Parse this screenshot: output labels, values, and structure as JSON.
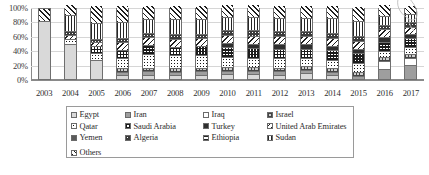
{
  "chart_data": {
    "type": "bar",
    "stacked": true,
    "normalized": "100%",
    "title": "",
    "xlabel": "",
    "ylabel": "",
    "ylim": [
      0,
      100
    ],
    "ytick_labels": [
      "100%",
      "80%",
      "60%",
      "40%",
      "20%",
      "0%"
    ],
    "ytick_values": [
      100,
      80,
      60,
      40,
      20,
      0
    ],
    "grid": true,
    "legend_position": "bottom",
    "categories": [
      "2003",
      "2004",
      "2005",
      "2006",
      "2007",
      "2008",
      "2009",
      "2010",
      "2011",
      "2012",
      "2013",
      "2014",
      "2015",
      "2016",
      "2017"
    ],
    "series": [
      {
        "name": "Egypt",
        "pattern": "p-lightgray",
        "values": [
          82,
          49,
          26,
          5,
          5,
          4,
          5,
          6,
          6,
          5,
          7,
          4,
          0,
          0,
          0
        ]
      },
      {
        "name": "Iran",
        "pattern": "p-midgray",
        "values": [
          0,
          0,
          0,
          2,
          3,
          3,
          3,
          3,
          3,
          3,
          3,
          3,
          3,
          13,
          18
        ]
      },
      {
        "name": "Iraq",
        "pattern": "p-white",
        "values": [
          0,
          0,
          0,
          0,
          0,
          0,
          0,
          0,
          0,
          0,
          0,
          0,
          0,
          10,
          9
        ]
      },
      {
        "name": "Israel",
        "pattern": "p-grid",
        "values": [
          0,
          0,
          0,
          5,
          4,
          4,
          4,
          4,
          4,
          4,
          4,
          4,
          4,
          4,
          4
        ]
      },
      {
        "name": "Qatar",
        "pattern": "p-dots",
        "values": [
          0,
          6,
          9,
          13,
          18,
          17,
          16,
          13,
          12,
          12,
          10,
          11,
          12,
          8,
          9
        ]
      },
      {
        "name": "Saudi Arabia",
        "pattern": "p-check",
        "values": [
          0,
          0,
          8,
          10,
          11,
          11,
          12,
          12,
          12,
          12,
          12,
          12,
          12,
          11,
          11
        ]
      },
      {
        "name": "Turkey",
        "pattern": "p-dark",
        "values": [
          0,
          0,
          0,
          0,
          0,
          0,
          0,
          5,
          5,
          5,
          5,
          5,
          5,
          5,
          5
        ]
      },
      {
        "name": "United Arab Emirates",
        "pattern": "p-diag-back",
        "values": [
          0,
          4,
          4,
          9,
          10,
          10,
          10,
          10,
          10,
          10,
          10,
          10,
          10,
          10,
          9
        ]
      },
      {
        "name": "Yemen",
        "pattern": "p-darkgray",
        "values": [
          0,
          0,
          0,
          0,
          0,
          0,
          0,
          0,
          0,
          0,
          0,
          0,
          0,
          0,
          0
        ]
      },
      {
        "name": "Algeria",
        "pattern": "p-dots-dark",
        "values": [
          0,
          4,
          3,
          5,
          5,
          5,
          5,
          6,
          6,
          6,
          6,
          6,
          6,
          5,
          5
        ]
      },
      {
        "name": "Ethiopia",
        "pattern": "p-horiz",
        "values": [
          0,
          0,
          0,
          0,
          0,
          0,
          0,
          0,
          0,
          0,
          0,
          0,
          0,
          0,
          0
        ]
      },
      {
        "name": "Sudan",
        "pattern": "p-vert",
        "values": [
          0,
          22,
          22,
          21,
          19,
          20,
          19,
          17,
          18,
          18,
          18,
          19,
          19,
          11,
          10
        ]
      },
      {
        "name": "Others",
        "pattern": "p-diag",
        "values": [
          16,
          13,
          24,
          23,
          18,
          19,
          19,
          17,
          17,
          17,
          17,
          18,
          21,
          16,
          12
        ]
      }
    ]
  },
  "legend": {
    "items": [
      {
        "label": "Egypt",
        "pattern": "p-lightgray"
      },
      {
        "label": "Iran",
        "pattern": "p-midgray"
      },
      {
        "label": "Iraq",
        "pattern": "p-white"
      },
      {
        "label": "Israel",
        "pattern": "p-grid"
      },
      {
        "label": "Qatar",
        "pattern": "p-dots"
      },
      {
        "label": "Saudi Arabia",
        "pattern": "p-check"
      },
      {
        "label": "Turkey",
        "pattern": "p-dark"
      },
      {
        "label": "United Arab Emirates",
        "pattern": "p-diag-back"
      },
      {
        "label": "Yemen",
        "pattern": "p-darkgray"
      },
      {
        "label": "Algeria",
        "pattern": "p-dots-dark"
      },
      {
        "label": "Ethiopia",
        "pattern": "p-horiz"
      },
      {
        "label": "Sudan",
        "pattern": "p-vert"
      },
      {
        "label": "Others",
        "pattern": "p-diag"
      }
    ]
  }
}
